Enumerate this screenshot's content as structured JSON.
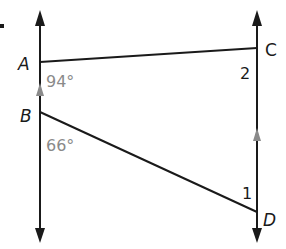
{
  "figure": {
    "bullet": "•",
    "points": {
      "A": {
        "label": "A"
      },
      "B": {
        "label": "B"
      },
      "C": {
        "label": "C"
      },
      "D": {
        "label": "D"
      }
    },
    "angles": {
      "at_A": {
        "label": "94°"
      },
      "at_B": {
        "label": "66°"
      },
      "angle_1": {
        "label": "1"
      },
      "angle_2": {
        "label": "2"
      }
    },
    "colors": {
      "line": "#1a1a1a",
      "parallel_marker": "#8a8a8a",
      "angle_text": "#8a8a8a"
    }
  }
}
